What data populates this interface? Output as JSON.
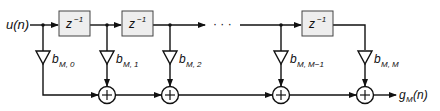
{
  "diagram": {
    "input_label": "u(n)",
    "output_label_main": "g",
    "output_label_sub": "M",
    "output_label_arg": "(n)",
    "delay_label": "z",
    "delay_exp": "−1",
    "ellipsis": "· · ·",
    "adder_symbol": "+",
    "coefficients": [
      {
        "main": "b",
        "sub": "M, 0"
      },
      {
        "main": "b",
        "sub": "M, 1"
      },
      {
        "main": "b",
        "sub": "M, 2"
      },
      {
        "main": "b",
        "sub": "M, M−1"
      },
      {
        "main": "b",
        "sub": "M, M"
      }
    ],
    "colors": {
      "line": "#111111",
      "box_fill": "#eeeeee",
      "box_stroke": "#444444"
    }
  }
}
